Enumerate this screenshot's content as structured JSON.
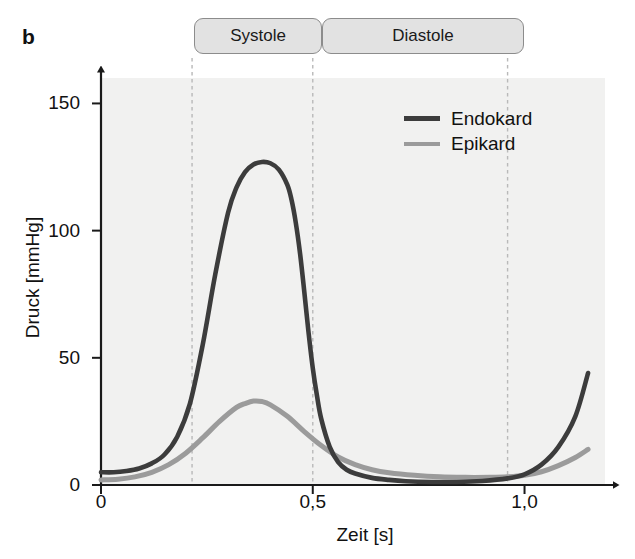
{
  "figure": {
    "panel_letter": "b"
  },
  "phases": [
    {
      "id": "systole",
      "label": "Systole",
      "t_start": 0.215,
      "t_end": 0.5
    },
    {
      "id": "diastole",
      "label": "Diastole",
      "t_start": 0.5,
      "t_end": 0.96
    }
  ],
  "colors": {
    "endokard": "#3c3c3c",
    "epikard": "#9b9b9b",
    "plot_background": "#f1f1f0",
    "axis": "#1a1a1a",
    "gridline": "#b9b9b9",
    "phase_box_fill": "#e2e2e2",
    "phase_box_border": "#8c8c8c"
  },
  "chart_data": {
    "type": "line",
    "title": "",
    "xlabel": "Zeit [s]",
    "ylabel": "Druck [mmHg]",
    "xlim": [
      0,
      1.19
    ],
    "ylim": [
      0,
      160
    ],
    "xticks": [
      0,
      0.5,
      1.0
    ],
    "xticklabels": [
      "0",
      "0,5",
      "1,0"
    ],
    "yticks": [
      0,
      50,
      100,
      150
    ],
    "yticklabels": [
      "0",
      "50",
      "100",
      "150"
    ],
    "grid": "vertical-dashed",
    "gridlines_x": [
      0.215,
      0.5,
      0.96
    ],
    "legend_position": "upper right",
    "legend": [
      "Endokard",
      "Epikard"
    ],
    "annotations": [
      "Systole",
      "Diastole",
      "b"
    ],
    "series": [
      {
        "name": "Endokard",
        "color": "#3c3c3c",
        "x": [
          0.0,
          0.03,
          0.06,
          0.09,
          0.12,
          0.15,
          0.18,
          0.21,
          0.24,
          0.27,
          0.3,
          0.32,
          0.34,
          0.36,
          0.38,
          0.4,
          0.42,
          0.44,
          0.45,
          0.46,
          0.47,
          0.48,
          0.49,
          0.5,
          0.51,
          0.52,
          0.54,
          0.56,
          0.58,
          0.6,
          0.64,
          0.68,
          0.72,
          0.78,
          0.84,
          0.9,
          0.96,
          1.0,
          1.04,
          1.08,
          1.12,
          1.15
        ],
        "y": [
          5.0,
          5.0,
          5.5,
          6.5,
          8.5,
          12.0,
          19.0,
          32.0,
          55.0,
          83.0,
          107.0,
          117.0,
          123.0,
          126.0,
          127.0,
          126.5,
          124.0,
          118.0,
          112.0,
          103.0,
          91.0,
          76.0,
          60.0,
          46.0,
          35.0,
          26.0,
          15.0,
          9.0,
          6.0,
          4.5,
          2.8,
          2.0,
          1.5,
          1.2,
          1.2,
          1.6,
          2.6,
          4.2,
          8.0,
          15.0,
          27.0,
          44.0
        ]
      },
      {
        "name": "Epikard",
        "color": "#9b9b9b",
        "x": [
          0.0,
          0.04,
          0.08,
          0.12,
          0.16,
          0.2,
          0.24,
          0.28,
          0.32,
          0.34,
          0.36,
          0.38,
          0.4,
          0.44,
          0.48,
          0.52,
          0.56,
          0.6,
          0.64,
          0.68,
          0.74,
          0.8,
          0.86,
          0.92,
          0.96,
          1.0,
          1.04,
          1.08,
          1.12,
          1.15
        ],
        "y": [
          2.0,
          2.3,
          3.2,
          5.0,
          8.0,
          12.5,
          18.5,
          25.0,
          30.5,
          32.0,
          33.0,
          32.8,
          31.5,
          27.0,
          21.0,
          15.5,
          11.0,
          8.0,
          6.0,
          4.8,
          3.8,
          3.2,
          3.0,
          3.0,
          3.2,
          3.8,
          5.2,
          7.6,
          10.8,
          14.0
        ]
      }
    ]
  }
}
